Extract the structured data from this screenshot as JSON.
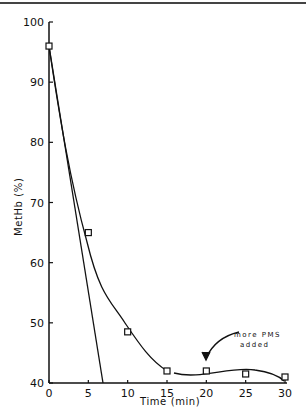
{
  "chart_data": {
    "type": "line",
    "title": "",
    "xlabel": "Time (min)",
    "ylabel": "MetHb (%)",
    "xlim": [
      0,
      30
    ],
    "ylim": [
      40,
      100
    ],
    "x_ticks": [
      "0",
      "5",
      "10",
      "15",
      "20",
      "25",
      "30"
    ],
    "y_ticks": [
      "40",
      "50",
      "60",
      "70",
      "80",
      "90",
      "100"
    ],
    "grid": false,
    "series": [
      {
        "name": "measured",
        "marker": "square",
        "x": [
          0,
          5,
          10,
          15,
          20,
          25,
          30
        ],
        "values": [
          96,
          65,
          48.5,
          42,
          42,
          41.5,
          41
        ]
      },
      {
        "name": "initial rate line",
        "marker": "none",
        "x": [
          0,
          6.9
        ],
        "values": [
          96,
          40
        ]
      }
    ],
    "annotations": [
      {
        "text_line1": "more PMS",
        "text_line2": "added",
        "x": 20,
        "y": 43
      }
    ]
  }
}
